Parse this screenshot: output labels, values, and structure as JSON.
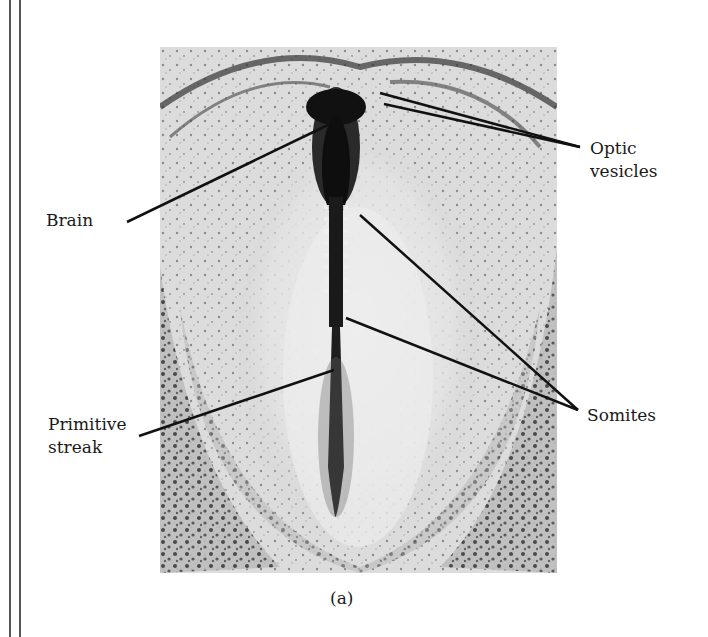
{
  "figure": {
    "caption": "(a)",
    "labels": {
      "brain": "Brain",
      "optic_vesicles_line1": "Optic",
      "optic_vesicles_line2": "vesicles",
      "primitive_streak_line1": "Primitive",
      "primitive_streak_line2": "streak",
      "somites": "Somites"
    }
  },
  "colors": {
    "line": "#111111",
    "background": "#ffffff"
  }
}
